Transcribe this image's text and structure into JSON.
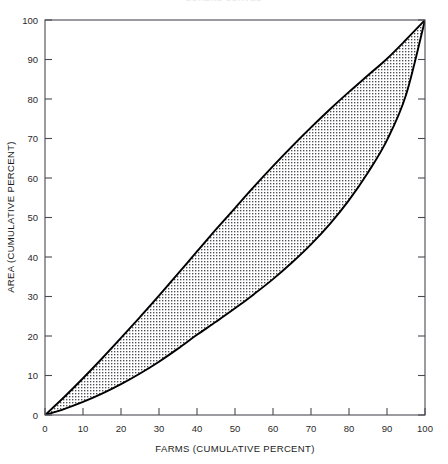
{
  "chart_title": "LORENZ CURVES",
  "chart_data": {
    "type": "area",
    "title": "LORENZ CURVES",
    "xlabel": "FARMS (CUMULATIVE PERCENT)",
    "ylabel": "AREA (CUMULATIVE PERCENT)",
    "xlim": [
      0,
      100
    ],
    "ylim": [
      0,
      100
    ],
    "grid": false,
    "legend": "none",
    "xticks": [
      0,
      10,
      20,
      30,
      40,
      50,
      60,
      70,
      80,
      90,
      100
    ],
    "yticks": [
      0,
      10,
      20,
      30,
      40,
      50,
      60,
      70,
      80,
      90,
      100
    ],
    "x": [
      0,
      5,
      10,
      15,
      20,
      25,
      30,
      35,
      40,
      45,
      50,
      55,
      60,
      65,
      70,
      75,
      80,
      85,
      90,
      95,
      100
    ],
    "series": [
      {
        "name": "Upper curve",
        "values": [
          0,
          4.5,
          9.3,
          14.3,
          19.5,
          24.8,
          30.2,
          35.8,
          41.4,
          47.0,
          52.4,
          57.8,
          63.0,
          68.0,
          72.8,
          77.4,
          81.8,
          86.0,
          90.2,
          95.0,
          100
        ]
      },
      {
        "name": "Lower curve",
        "values": [
          0,
          1.5,
          3.3,
          5.4,
          7.8,
          10.5,
          13.5,
          16.8,
          20.3,
          23.6,
          27.0,
          30.6,
          34.4,
          38.6,
          43.2,
          48.4,
          54.4,
          61.4,
          69.6,
          81.0,
          100
        ]
      }
    ],
    "shaded_region": {
      "between": [
        "Upper curve",
        "Lower curve"
      ],
      "pattern": "dot-grid stipple"
    }
  },
  "axes": {
    "x": {
      "title": "FARMS (CUMULATIVE PERCENT)",
      "labels": [
        "0",
        "10",
        "20",
        "30",
        "40",
        "50",
        "60",
        "70",
        "80",
        "90",
        "100"
      ]
    },
    "y": {
      "title": "AREA (CUMULATIVE PERCENT)",
      "labels": [
        "0",
        "10",
        "20",
        "30",
        "40",
        "50",
        "60",
        "70",
        "80",
        "90",
        "100"
      ]
    }
  }
}
